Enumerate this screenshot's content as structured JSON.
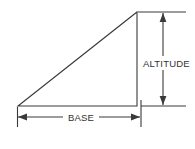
{
  "figure": {
    "background_color": "#ffffff",
    "line_color": "#3a3a3a",
    "text_color": "#333333",
    "labels": {
      "base": "BASE",
      "altitude": "ALTITUDE"
    },
    "shape": {
      "type": "right-triangle",
      "vertices": {
        "left": [
          18,
          106
        ],
        "right_angle": [
          137,
          106
        ],
        "apex": [
          137,
          12
        ]
      }
    },
    "dimensions": {
      "base": {
        "label": "BASE",
        "orientation": "horizontal",
        "line_y": 117,
        "from_x": 18,
        "to_x": 140
      },
      "altitude": {
        "label": "ALTITUDE",
        "orientation": "vertical",
        "line_x": 163,
        "from_y": 13,
        "to_y": 105
      }
    }
  }
}
